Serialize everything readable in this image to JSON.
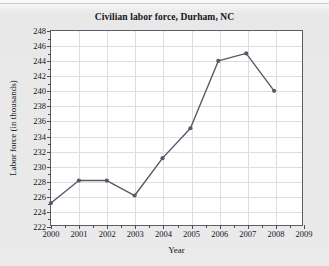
{
  "chart_data": {
    "type": "line",
    "title": "Civilian labor force, Durham, NC",
    "xlabel": "Year",
    "ylabel": "Labor force (in thousands)",
    "x": [
      2000,
      2001,
      2002,
      2003,
      2004,
      2005,
      2006,
      2007,
      2008
    ],
    "values": [
      225,
      228,
      228,
      226,
      231,
      235,
      244,
      245,
      240
    ],
    "series": [
      {
        "name": "Civilian labor force",
        "values": [
          225,
          228,
          228,
          226,
          231,
          235,
          244,
          245,
          240
        ]
      }
    ],
    "xlim": [
      2000,
      2009
    ],
    "ylim": [
      222,
      248
    ],
    "xticks": [
      2000,
      2001,
      2002,
      2003,
      2004,
      2005,
      2006,
      2007,
      2008,
      2009
    ],
    "xticklabels": [
      "2000",
      "2001",
      "2002",
      "2003",
      "2004",
      "2005",
      "2006",
      "2007",
      "2008",
      "2009"
    ],
    "yticks": [
      222,
      224,
      226,
      228,
      230,
      232,
      234,
      236,
      238,
      240,
      242,
      244,
      246,
      248
    ],
    "yticklabels": [
      "222",
      "224",
      "226",
      "228",
      "230",
      "232",
      "234",
      "236",
      "238",
      "240",
      "242",
      "244",
      "246",
      "248"
    ],
    "grid": true,
    "legend": false,
    "marker": "circle",
    "line_color": "#555a66",
    "marker_color": "#555a66",
    "grid_color": "#dedede",
    "axis_color": "#5d5d66",
    "plot_background": "#ffffff",
    "figure_background": "#eaeaea"
  }
}
